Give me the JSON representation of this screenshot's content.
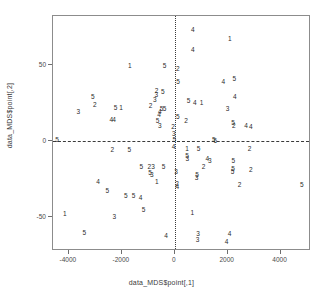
{
  "top_ghost_text": "",
  "chart_data": {
    "type": "scatter",
    "title": "",
    "xlabel": "data_MDS$point[,1]",
    "ylabel": "data_MDS$point[,2]",
    "xlim": [
      -4600,
      5150
    ],
    "ylim": [
      -72,
      82
    ],
    "grid": false,
    "legend": "none",
    "point_marker": "cluster-number-digit",
    "reference_lines": [
      {
        "axis": "x",
        "value": 0,
        "style": "dotted"
      },
      {
        "axis": "y",
        "value": 0,
        "style": "dashed"
      }
    ],
    "xticks": [
      -4000,
      -2000,
      0,
      2000,
      4000
    ],
    "xtick_labels": [
      "-4000",
      "-2000",
      "0",
      "2000",
      "4000"
    ],
    "yticks": [
      50,
      0,
      -50
    ],
    "ytick_labels": [
      "50",
      "0",
      "-50"
    ],
    "series_note": "Each plotted glyph is the cluster id (1-5) drawn at the MDS coordinate.",
    "points": [
      {
        "x": 680,
        "y": 73,
        "label": "4"
      },
      {
        "x": 2080,
        "y": 67,
        "label": "1"
      },
      {
        "x": 680,
        "y": 60,
        "label": "4"
      },
      {
        "x": -1700,
        "y": 49,
        "label": "1"
      },
      {
        "x": -380,
        "y": 49,
        "label": "5"
      },
      {
        "x": 120,
        "y": 47,
        "label": "2"
      },
      {
        "x": 2250,
        "y": 41,
        "label": "5"
      },
      {
        "x": 1840,
        "y": 39,
        "label": "4"
      },
      {
        "x": 130,
        "y": 39,
        "label": "5"
      },
      {
        "x": -690,
        "y": 33,
        "label": "2"
      },
      {
        "x": -450,
        "y": 32,
        "label": "5"
      },
      {
        "x": -700,
        "y": 30,
        "label": "3"
      },
      {
        "x": -3100,
        "y": 29,
        "label": "5"
      },
      {
        "x": 2270,
        "y": 29,
        "label": "4"
      },
      {
        "x": -750,
        "y": 27,
        "label": "3"
      },
      {
        "x": 520,
        "y": 26,
        "label": "5"
      },
      {
        "x": 760,
        "y": 25,
        "label": "4"
      },
      {
        "x": 1010,
        "y": 25,
        "label": "1"
      },
      {
        "x": -3020,
        "y": 24,
        "label": "2"
      },
      {
        "x": -910,
        "y": 23,
        "label": "2"
      },
      {
        "x": -2240,
        "y": 22,
        "label": "5"
      },
      {
        "x": -2030,
        "y": 22,
        "label": "1"
      },
      {
        "x": -500,
        "y": 21,
        "label": "5"
      },
      {
        "x": -380,
        "y": 21,
        "label": "5"
      },
      {
        "x": 2000,
        "y": 21,
        "label": "3"
      },
      {
        "x": -3640,
        "y": 19,
        "label": "3"
      },
      {
        "x": -560,
        "y": 19,
        "label": "4"
      },
      {
        "x": -590,
        "y": 17,
        "label": "4"
      },
      {
        "x": 120,
        "y": 16,
        "label": "5"
      },
      {
        "x": -2400,
        "y": 14,
        "label": "4"
      },
      {
        "x": -2290,
        "y": 14,
        "label": "4"
      },
      {
        "x": -650,
        "y": 13,
        "label": "5"
      },
      {
        "x": 430,
        "y": 13,
        "label": "2"
      },
      {
        "x": 2200,
        "y": 12,
        "label": "5"
      },
      {
        "x": 2230,
        "y": 10,
        "label": "2"
      },
      {
        "x": 2700,
        "y": 10,
        "label": "4"
      },
      {
        "x": 2880,
        "y": 9,
        "label": "4"
      },
      {
        "x": -560,
        "y": 10,
        "label": "3"
      },
      {
        "x": -60,
        "y": 9,
        "label": "2"
      },
      {
        "x": -30,
        "y": 5,
        "label": "3"
      },
      {
        "x": -4450,
        "y": 1,
        "label": "5"
      },
      {
        "x": -20,
        "y": 1,
        "label": "5"
      },
      {
        "x": 1480,
        "y": 1,
        "label": "5"
      },
      {
        "x": 1530,
        "y": 0,
        "label": "6"
      },
      {
        "x": -40,
        "y": -4,
        "label": "4"
      },
      {
        "x": 2830,
        "y": -5,
        "label": "2"
      },
      {
        "x": -2360,
        "y": -6,
        "label": "2"
      },
      {
        "x": -1720,
        "y": -6,
        "label": "5"
      },
      {
        "x": 470,
        "y": -5,
        "label": "1"
      },
      {
        "x": 900,
        "y": -5,
        "label": "5"
      },
      {
        "x": 470,
        "y": -10,
        "label": "5"
      },
      {
        "x": 480,
        "y": -12,
        "label": "3"
      },
      {
        "x": 1230,
        "y": -12,
        "label": "4"
      },
      {
        "x": 1330,
        "y": -13,
        "label": "3"
      },
      {
        "x": 2210,
        "y": -13,
        "label": "5"
      },
      {
        "x": -1260,
        "y": -17,
        "label": "5"
      },
      {
        "x": -960,
        "y": -17,
        "label": "2"
      },
      {
        "x": -820,
        "y": -17,
        "label": "3"
      },
      {
        "x": -420,
        "y": -17,
        "label": "5"
      },
      {
        "x": 1090,
        "y": -17,
        "label": "2"
      },
      {
        "x": 2200,
        "y": -18,
        "label": "5"
      },
      {
        "x": 2190,
        "y": -20,
        "label": "5"
      },
      {
        "x": 2880,
        "y": -19,
        "label": "2"
      },
      {
        "x": -930,
        "y": -21,
        "label": "5"
      },
      {
        "x": -870,
        "y": -22,
        "label": "3"
      },
      {
        "x": 50,
        "y": -20,
        "label": "3"
      },
      {
        "x": 840,
        "y": -22,
        "label": "5"
      },
      {
        "x": 830,
        "y": -24,
        "label": "3"
      },
      {
        "x": -2900,
        "y": -27,
        "label": "4"
      },
      {
        "x": -680,
        "y": -27,
        "label": "1"
      },
      {
        "x": 90,
        "y": -28,
        "label": "2"
      },
      {
        "x": 100,
        "y": -30,
        "label": "4"
      },
      {
        "x": 2450,
        "y": -29,
        "label": "2"
      },
      {
        "x": 4800,
        "y": -29,
        "label": "5"
      },
      {
        "x": -2550,
        "y": -33,
        "label": "5"
      },
      {
        "x": -1850,
        "y": -36,
        "label": "5"
      },
      {
        "x": -1560,
        "y": -36,
        "label": "5"
      },
      {
        "x": -1290,
        "y": -37,
        "label": "4"
      },
      {
        "x": -4150,
        "y": -48,
        "label": "1"
      },
      {
        "x": -2280,
        "y": -50,
        "label": "3"
      },
      {
        "x": -1180,
        "y": -45,
        "label": "5"
      },
      {
        "x": 660,
        "y": -47,
        "label": "1"
      },
      {
        "x": -3420,
        "y": -60,
        "label": "5"
      },
      {
        "x": -330,
        "y": -62,
        "label": "4"
      },
      {
        "x": 880,
        "y": -61,
        "label": "3"
      },
      {
        "x": 860,
        "y": -65,
        "label": "3"
      },
      {
        "x": 2070,
        "y": -61,
        "label": "4"
      },
      {
        "x": 1960,
        "y": -66,
        "label": "4"
      }
    ]
  }
}
